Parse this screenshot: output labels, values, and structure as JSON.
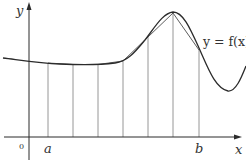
{
  "diagram": {
    "labels": {
      "y_axis": "y",
      "x_axis": "x",
      "origin": "0",
      "a": "a",
      "b": "b",
      "curve": "y = f(x)"
    },
    "colors": {
      "curve": "#2b2b2b",
      "axes": "#2b2b2b",
      "ordinates": "#8a8a8a",
      "chords": "#4a4a4a",
      "text": "#333333"
    },
    "ordinate_count": 7,
    "strip_count": 6
  }
}
